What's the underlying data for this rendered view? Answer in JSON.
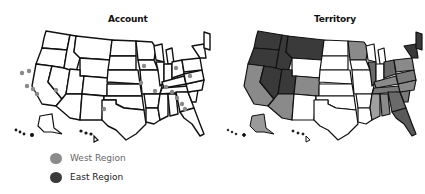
{
  "title_cutoff": "…",
  "maps": {
    "account": {
      "title": "Account",
      "points": [
        {
          "x": 18,
          "y": 49
        },
        {
          "x": 25,
          "y": 47
        },
        {
          "x": 23,
          "y": 62
        },
        {
          "x": 29,
          "y": 65
        },
        {
          "x": 33,
          "y": 70
        },
        {
          "x": 52,
          "y": 66
        },
        {
          "x": 100,
          "y": 85
        },
        {
          "x": 137,
          "y": 59
        },
        {
          "x": 151,
          "y": 67
        },
        {
          "x": 162,
          "y": 63
        },
        {
          "x": 168,
          "y": 68
        },
        {
          "x": 173,
          "y": 74
        },
        {
          "x": 178,
          "y": 80
        },
        {
          "x": 181,
          "y": 85
        },
        {
          "x": 186,
          "y": 52
        },
        {
          "x": 172,
          "y": 44
        },
        {
          "x": 140,
          "y": 42
        }
      ]
    },
    "territory": {
      "title": "Territory"
    }
  },
  "legend": {
    "items": [
      {
        "label": "West Region",
        "color": "#8a8a8a"
      },
      {
        "label": "East Region",
        "color": "#3a3a3a"
      }
    ]
  },
  "colors": {
    "west": "#8a8a8a",
    "east": "#3a3a3a",
    "unassigned": "#ffffff",
    "border": "#111111"
  }
}
